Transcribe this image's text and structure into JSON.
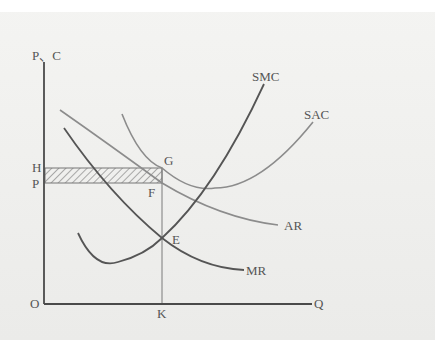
{
  "diagram": {
    "title": "",
    "axes": {
      "y_label": "P、C",
      "x_label": "Q",
      "origin_label": "O"
    },
    "price_levels": {
      "H": "H",
      "P": "P"
    },
    "points": {
      "G": "G",
      "F": "F",
      "E": "E",
      "K": "K"
    },
    "curves": {
      "SMC": "SMC",
      "SAC": "SAC",
      "AR": "AR",
      "MR": "MR"
    },
    "colors": {
      "background": "#ececea",
      "axis": "#4a4a4a",
      "dark_curve": "#555555",
      "light_curve": "#8c8c8c",
      "hatch": "#777777",
      "text": "#555555"
    },
    "shaded_region": "profit rectangle between H and P, from O to K"
  }
}
